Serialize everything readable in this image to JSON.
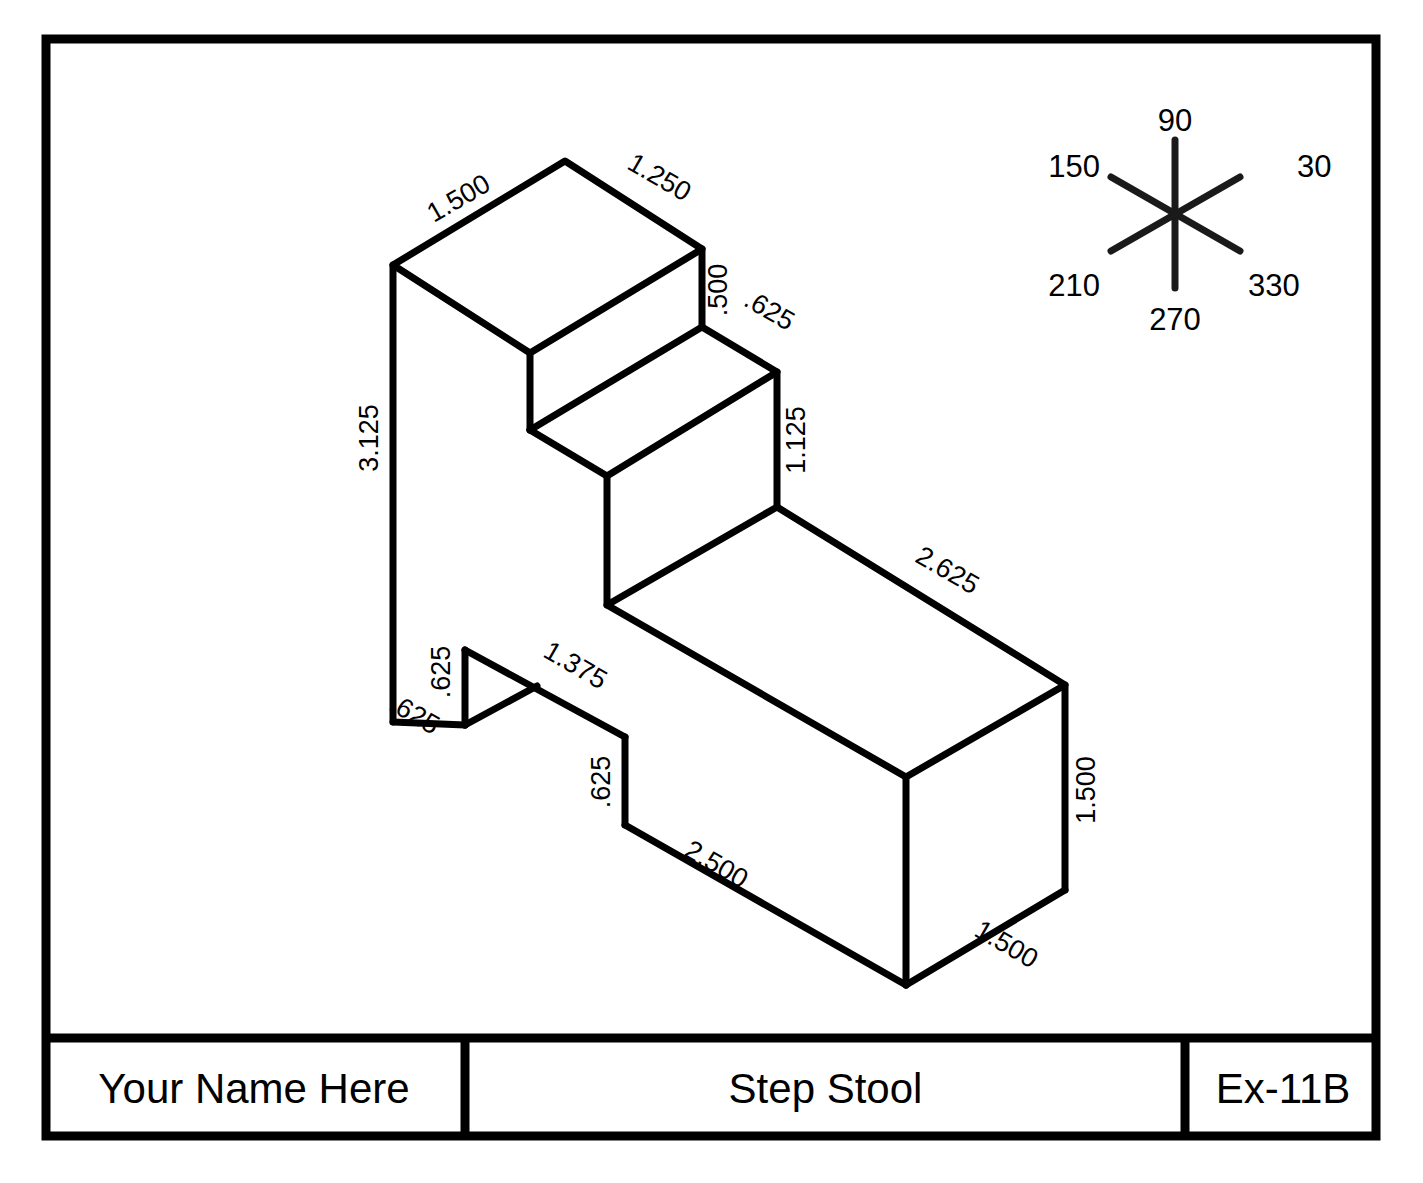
{
  "sheet": {
    "width": 1423,
    "height": 1183,
    "background": "#ffffff",
    "line_color": "#000000"
  },
  "title_block": {
    "name": "Your Name Here",
    "title": "Step Stool",
    "number": "Ex-11B"
  },
  "axis_indicator": {
    "name": "isometric-axis-compass",
    "labels": {
      "deg30": "30",
      "deg90": "90",
      "deg150": "150",
      "deg210": "210",
      "deg270": "270",
      "deg330": "330"
    }
  },
  "dimensions": [
    {
      "id": "d-1500-top-left",
      "value": "1.500",
      "x": 463,
      "y": 206,
      "rotate": -30
    },
    {
      "id": "d-1250-top-right",
      "value": "1.250",
      "x": 655,
      "y": 185,
      "rotate": 30
    },
    {
      "id": "d-500-riser",
      "value": ".500",
      "x": 727,
      "y": 290,
      "rotate": -90
    },
    {
      "id": "d-625-step-tread",
      "value": ".625",
      "x": 765,
      "y": 318,
      "rotate": 30
    },
    {
      "id": "d-1125-mid-riser",
      "value": "1.125",
      "x": 805,
      "y": 440,
      "rotate": -90
    },
    {
      "id": "d-3125-left-height",
      "value": "3.125",
      "x": 378,
      "y": 438,
      "rotate": -90
    },
    {
      "id": "d-2625-top-long",
      "value": "2.625",
      "x": 943,
      "y": 578,
      "rotate": 30
    },
    {
      "id": "d-625-notch-riser",
      "value": ".625",
      "x": 450,
      "y": 672,
      "rotate": -90
    },
    {
      "id": "d-1375-notch-top",
      "value": "1.375",
      "x": 571,
      "y": 673,
      "rotate": 30
    },
    {
      "id": "d-625-base-left",
      "value": ".625",
      "x": 410,
      "y": 722,
      "rotate": 30
    },
    {
      "id": "d-625-base-riser",
      "value": ".625",
      "x": 610,
      "y": 782,
      "rotate": -90
    },
    {
      "id": "d-1500-right-height",
      "value": "1.500",
      "x": 1095,
      "y": 790,
      "rotate": -90
    },
    {
      "id": "d-2500-base-front",
      "value": "2.500",
      "x": 712,
      "y": 872,
      "rotate": 30
    },
    {
      "id": "d-1500-base-right",
      "value": "1.500",
      "x": 1002,
      "y": 952,
      "rotate": 30
    }
  ],
  "geometry": {
    "description": "isometric step stool solid outline"
  }
}
